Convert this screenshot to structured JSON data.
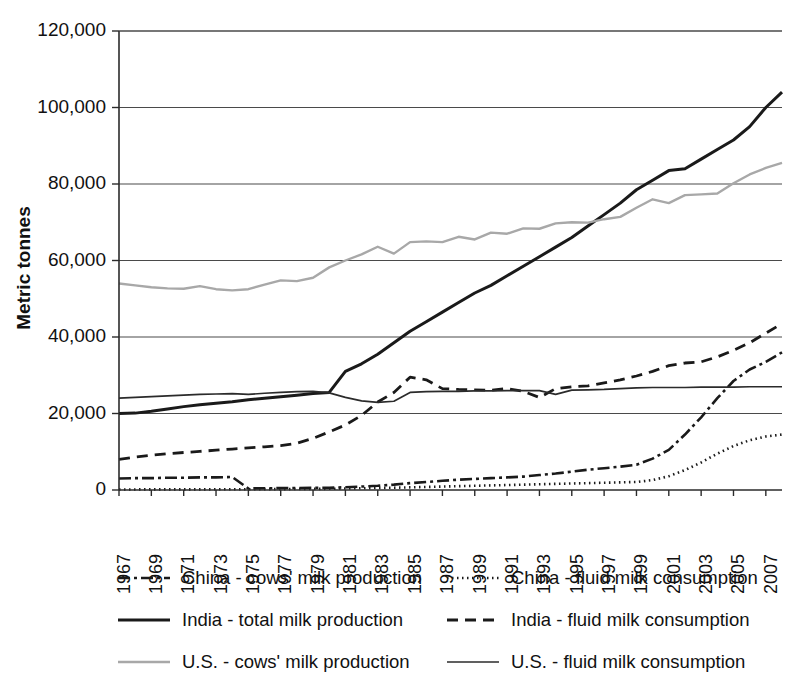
{
  "chart_data": {
    "type": "line",
    "title": "",
    "xlabel": "",
    "ylabel": "Metric tonnes",
    "ylim": [
      0,
      120000
    ],
    "xlim": [
      1967,
      2008
    ],
    "grid": true,
    "legend_position": "bottom",
    "ytick_labels": [
      "120,000",
      "100,000",
      "80,000",
      "60,000",
      "40,000",
      "20,000",
      "0"
    ],
    "ytick_values": [
      120000,
      100000,
      80000,
      60000,
      40000,
      20000,
      0
    ],
    "xtick_labels": [
      "1967",
      "1969",
      "1971",
      "1973",
      "1975",
      "1977",
      "1979",
      "1981",
      "1983",
      "1985",
      "1987",
      "1989",
      "1991",
      "1993",
      "1995",
      "1997",
      "1999",
      "2001",
      "2003",
      "2005",
      "2007"
    ],
    "xtick_values": [
      1967,
      1969,
      1971,
      1973,
      1975,
      1977,
      1979,
      1981,
      1983,
      1985,
      1987,
      1989,
      1991,
      1993,
      1995,
      1997,
      1999,
      2001,
      2003,
      2005,
      2007
    ],
    "x": [
      1967,
      1968,
      1969,
      1970,
      1971,
      1972,
      1973,
      1974,
      1975,
      1976,
      1977,
      1978,
      1979,
      1980,
      1981,
      1982,
      1983,
      1984,
      1985,
      1986,
      1987,
      1988,
      1989,
      1990,
      1991,
      1992,
      1993,
      1994,
      1995,
      1996,
      1997,
      1998,
      1999,
      2000,
      2001,
      2002,
      2003,
      2004,
      2005,
      2006,
      2007,
      2008
    ],
    "series": [
      {
        "name": "China - cows' milk production",
        "key": "china-cows-milk-production",
        "style": "dashdot",
        "color": "#1a1a1a",
        "width": 2.6,
        "dasharray": "12,4,3,4",
        "values": [
          3000,
          3100,
          3100,
          3200,
          3200,
          3300,
          3300,
          3400,
          400,
          450,
          500,
          520,
          560,
          600,
          700,
          900,
          1100,
          1400,
          1800,
          2100,
          2400,
          2700,
          2900,
          3100,
          3300,
          3500,
          3900,
          4300,
          4800,
          5300,
          5700,
          6100,
          6600,
          8200,
          10500,
          14500,
          19000,
          24000,
          28500,
          31500,
          33500,
          36000
        ]
      },
      {
        "name": "China - fluid milk consumption",
        "key": "china-fluid-milk-consumption",
        "style": "dotted",
        "color": "#1a1a1a",
        "width": 2.6,
        "dasharray": "1.5,3.5",
        "values": [
          150,
          150,
          160,
          160,
          170,
          170,
          180,
          190,
          200,
          210,
          230,
          250,
          280,
          320,
          380,
          450,
          520,
          600,
          700,
          800,
          900,
          1000,
          1100,
          1200,
          1300,
          1400,
          1500,
          1600,
          1700,
          1800,
          1900,
          2000,
          2100,
          2600,
          3600,
          5200,
          7200,
          9500,
          11500,
          13000,
          14000,
          14500
        ]
      },
      {
        "name": "India - total milk production",
        "key": "india-total-milk-production",
        "style": "solid",
        "color": "#1a1a1a",
        "width": 3.0,
        "dasharray": "",
        "values": [
          20000,
          20100,
          20600,
          21200,
          21800,
          22300,
          22700,
          23100,
          23600,
          24000,
          24400,
          24800,
          25200,
          25500,
          31000,
          33000,
          35500,
          38500,
          41500,
          44000,
          46500,
          49000,
          51500,
          53500,
          56000,
          58500,
          61000,
          63500,
          66000,
          69000,
          72000,
          75000,
          78500,
          81000,
          83500,
          84000,
          86500,
          89000,
          91500,
          95000,
          100000,
          104000
        ]
      },
      {
        "name": "India - fluid milk consumption",
        "key": "india-fluid-milk-consumption",
        "style": "dashed",
        "color": "#1a1a1a",
        "width": 2.8,
        "dasharray": "11,7",
        "values": [
          8000,
          8600,
          9100,
          9500,
          9800,
          10100,
          10400,
          10700,
          11000,
          11300,
          11600,
          12200,
          13500,
          15200,
          17000,
          19500,
          23000,
          25500,
          29500,
          28800,
          26500,
          26300,
          26200,
          26100,
          26500,
          25800,
          24200,
          26500,
          27000,
          27200,
          28000,
          28800,
          29800,
          31000,
          32500,
          33200,
          33500,
          34800,
          36500,
          38500,
          41000,
          43500
        ]
      },
      {
        "name": "U.S. - cows' milk production",
        "key": "us-cows-milk-production",
        "style": "solid-light",
        "color": "#a8a8a8",
        "width": 2.4,
        "dasharray": "",
        "values": [
          54000,
          53500,
          53000,
          52700,
          52600,
          53300,
          52500,
          52200,
          52500,
          53700,
          54800,
          54600,
          55500,
          58200,
          60000,
          61600,
          63600,
          61800,
          64800,
          65000,
          64800,
          66200,
          65500,
          67300,
          67000,
          68400,
          68300,
          69700,
          70000,
          69900,
          70800,
          71400,
          73800,
          76000,
          75000,
          77100,
          77300,
          77500,
          80200,
          82500,
          84200,
          85500
        ]
      },
      {
        "name": "U.S. - fluid milk consumption",
        "key": "us-fluid-milk-consumption",
        "style": "solid-thin",
        "color": "#2b2b2b",
        "width": 1.7,
        "dasharray": "",
        "values": [
          24000,
          24200,
          24400,
          24600,
          24800,
          25000,
          25100,
          25200,
          25000,
          25300,
          25500,
          25700,
          25800,
          25400,
          24200,
          23300,
          22900,
          23200,
          25500,
          25700,
          25800,
          25800,
          25900,
          25900,
          26000,
          26000,
          26000,
          25000,
          26100,
          26200,
          26300,
          26500,
          26700,
          26800,
          26800,
          26800,
          26900,
          26900,
          26900,
          27000,
          27000,
          27000
        ]
      }
    ]
  },
  "legend": {
    "items": [
      {
        "label": "China - cows' milk production",
        "series_key": "china-cows-milk-production"
      },
      {
        "label": "China - fluid milk consumption",
        "series_key": "china-fluid-milk-consumption"
      },
      {
        "label": "India - total milk production",
        "series_key": "india-total-milk-production"
      },
      {
        "label": "India - fluid milk consumption",
        "series_key": "india-fluid-milk-consumption"
      },
      {
        "label": "U.S. - cows' milk production",
        "series_key": "us-cows-milk-production"
      },
      {
        "label": "U.S. - fluid milk consumption",
        "series_key": "us-fluid-milk-consumption"
      }
    ]
  }
}
